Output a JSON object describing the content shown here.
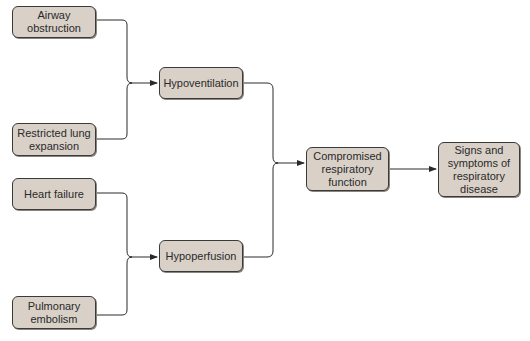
{
  "diagram": {
    "nodes": {
      "airway": "Airway obstruction",
      "restricted": "Restricted lung expansion",
      "heart": "Heart failure",
      "embolism": "Pulmonary embolism",
      "hypoventilation": "Hypoventilation",
      "hypoperfusion": "Hypoperfusion",
      "compromised": "Compromised respiratory function",
      "signs": "Signs and symptoms of respiratory disease"
    },
    "colors": {
      "node_fill": "#d9d1c8",
      "node_border": "#3a3a3a",
      "line": "#2a2a2a"
    }
  }
}
